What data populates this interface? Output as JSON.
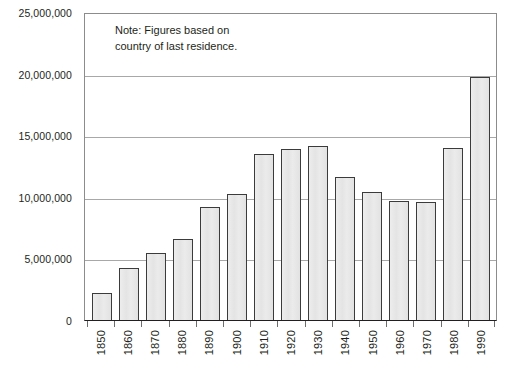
{
  "chart_data": {
    "type": "bar",
    "title": "",
    "xlabel": "",
    "ylabel": "",
    "categories": [
      "1850",
      "1860",
      "1870",
      "1880",
      "1890",
      "1900",
      "1910",
      "1920",
      "1930",
      "1940",
      "1950",
      "1960",
      "1970",
      "1980",
      "1990"
    ],
    "values": [
      2200000,
      4200000,
      5400000,
      6600000,
      9200000,
      10250000,
      13500000,
      13900000,
      14100000,
      11600000,
      10400000,
      9700000,
      9600000,
      14000000,
      19700000
    ],
    "ylim": [
      0,
      25000000
    ],
    "ytick_labels": [
      "25,000,000",
      "20,000,000",
      "15,000,000",
      "10,000,000",
      "5,000,000",
      "0"
    ],
    "ytick_values": [
      25000000,
      20000000,
      15000000,
      10000000,
      5000000,
      0
    ],
    "grid": "horizontal",
    "legend": "none",
    "annotations": [
      {
        "name": "note",
        "line1": "Note: Figures based on",
        "line2": "country of last residence."
      }
    ],
    "colors": {
      "bar_fill": "#e6e6e6",
      "bar_border": "#3b3b3b",
      "gridline": "#a8a8a8",
      "axis": "#231f20",
      "text": "#231f20",
      "background": "#ffffff"
    }
  }
}
